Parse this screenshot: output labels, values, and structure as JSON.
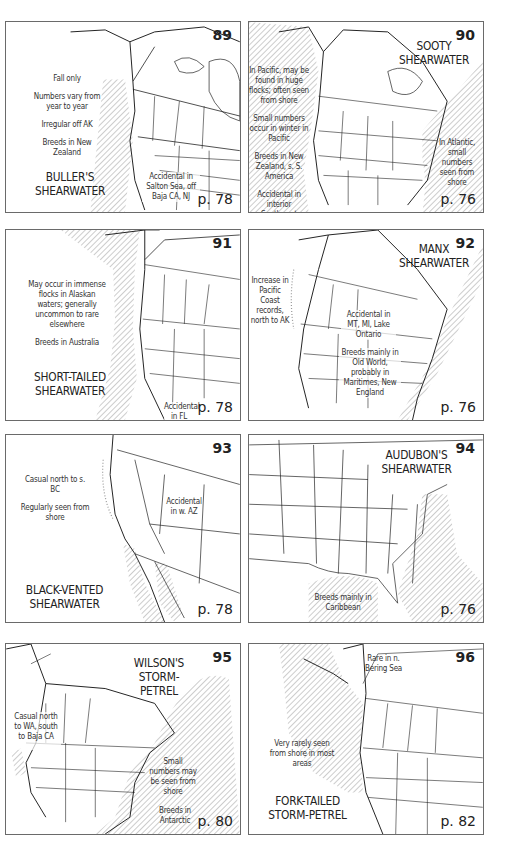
{
  "page": {
    "panels": [
      {
        "number": "89",
        "species": "BULLER'S SHEARWATER",
        "title_lines": [
          "BULLER'S",
          "SHEARWATER"
        ],
        "notes": [
          "Fall only",
          "Numbers vary from year to year",
          "Irregular off AK",
          "Breeds in New Zealand"
        ],
        "callout": "Accidental in Salton Sea, off Baja CA, NJ",
        "page_ref": "p. 78"
      },
      {
        "number": "90",
        "species": "SOOTY SHEARWATER",
        "title_lines": [
          "SOOTY",
          "SHEARWATER"
        ],
        "notes": [
          "In Pacific, may be found in huge flocks; often seen from shore",
          "Small numbers occur in winter in Pacific",
          "Breeds in New Zealand, s. S. America",
          "Accidental in interior Southwest"
        ],
        "callout": "In Atlantic, small numbers seen from shore",
        "page_ref": "p. 76"
      },
      {
        "number": "91",
        "species": "SHORT-TAILED SHEARWATER",
        "title_lines": [
          "SHORT-TAILED",
          "SHEARWATER"
        ],
        "notes": [
          "May occur in immense flocks in Alaskan waters; generally uncommon to rare elsewhere",
          "Breeds in Australia"
        ],
        "callout": "Accidental in FL",
        "page_ref": "p. 78"
      },
      {
        "number": "92",
        "species": "MANX SHEARWATER",
        "title_lines": [
          "MANX",
          "SHEARWATER"
        ],
        "notes": [
          "Increase in Pacific Coast records, north to AK"
        ],
        "callout": "Accidental in MT, MI, Lake Ontario",
        "callout2": "Breeds mainly in Old World, probably in Maritimes, New England",
        "page_ref": "p. 76"
      },
      {
        "number": "93",
        "species": "BLACK-VENTED SHEARWATER",
        "title_lines": [
          "BLACK-VENTED",
          "SHEARWATER"
        ],
        "notes": [
          "Casual north to s. BC",
          "Regularly seen from shore"
        ],
        "callout": "Accidental in w. AZ",
        "page_ref": "p. 78"
      },
      {
        "number": "94",
        "species": "AUDUBON'S SHEARWATER",
        "title_lines": [
          "AUDUBON'S",
          "SHEARWATER"
        ],
        "notes": [],
        "callout": "Breeds mainly in Caribbean",
        "page_ref": "p. 76"
      },
      {
        "number": "95",
        "species": "WILSON'S STORM-PETREL",
        "title_lines": [
          "WILSON'S",
          "STORM-PETREL"
        ],
        "notes": [
          "Casual north to WA, south to Baja CA"
        ],
        "callout": "Small numbers may be seen from shore",
        "callout2": "Breeds in Antarctic",
        "page_ref": "p. 80"
      },
      {
        "number": "96",
        "species": "FORK-TAILED STORM-PETREL",
        "title_lines": [
          "FORK-TAILED",
          "STORM-PETREL"
        ],
        "notes": [
          "Very rarely seen from shore in most areas"
        ],
        "callout": "Rare in n. Bering Sea",
        "page_ref": "p. 82"
      }
    ],
    "colors": {
      "border": "#6a6a6a",
      "land_line": "#222222",
      "hatch": "#9a9a9a"
    },
    "icons": {
      "range_hatch": "diagonal-hatch-pattern",
      "casual_dots": "dotted-line"
    }
  }
}
